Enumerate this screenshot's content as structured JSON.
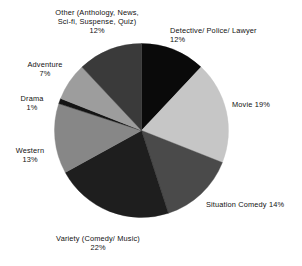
{
  "chart_data": {
    "type": "pie",
    "title": "",
    "subtitle": "",
    "xlabel": "",
    "ylabel": "",
    "legend_position": "none",
    "grid": false,
    "units": "percent",
    "total": 100,
    "start_angle_deg": 0,
    "direction": "clockwise",
    "categories": [
      "Detective/ Police/ Lawyer",
      "Movie",
      "Situation Comedy",
      "Variety (Comedy/ Music)",
      "Western",
      "Drama",
      "Adventure",
      "Other (Anthology, News, Sci-fi, Suspense, Quiz)"
    ],
    "values": [
      12,
      19,
      14,
      22,
      13,
      1,
      7,
      12
    ],
    "colors": [
      "#0a0a0a",
      "#c6c6c6",
      "#4a4a4a",
      "#1e1e1e",
      "#878787",
      "#141414",
      "#9d9d9d",
      "#3a3a3a"
    ],
    "slices": [
      {
        "label": "Detective/ Police/ Lawyer",
        "value": 12,
        "color": "#0a0a0a"
      },
      {
        "label": "Movie",
        "value": 19,
        "color": "#c6c6c6"
      },
      {
        "label": "Situation Comedy",
        "value": 14,
        "color": "#4a4a4a"
      },
      {
        "label": "Variety (Comedy/ Music)",
        "value": 22,
        "color": "#1e1e1e"
      },
      {
        "label": "Western",
        "value": 13,
        "color": "#878787"
      },
      {
        "label": "Drama",
        "value": 1,
        "color": "#141414"
      },
      {
        "label": "Adventure",
        "value": 7,
        "color": "#9d9d9d"
      },
      {
        "label": "Other (Anthology, News, Sci-fi, Suspense, Quiz)",
        "value": 12,
        "color": "#3a3a3a"
      }
    ]
  },
  "labels": {
    "other": {
      "line1": "Other (Anthology, News,",
      "line2": "Sci-fi, Suspense, Quiz)",
      "line3": "12%"
    },
    "detective": {
      "line1": "Detective/ Police/ Lawyer",
      "line2": "12%"
    },
    "movie": {
      "line1": "Movie 19%"
    },
    "sitcom": {
      "line1": "Situation Comedy 14%"
    },
    "variety": {
      "line1": "Variety (Comedy/ Music)",
      "line2": "22%"
    },
    "western": {
      "line1": "Western",
      "line2": "13%"
    },
    "drama": {
      "line1": "Drama",
      "line2": "1%"
    },
    "adventure": {
      "line1": "Adventure",
      "line2": "7%"
    }
  }
}
